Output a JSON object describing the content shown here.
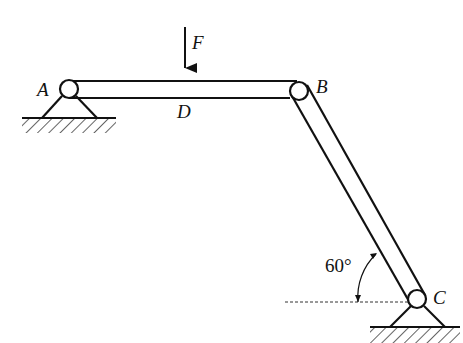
{
  "diagram": {
    "type": "frame-mechanics",
    "labels": {
      "A": "A",
      "B": "B",
      "C": "C",
      "D": "D",
      "force": "F",
      "angle": "60°"
    },
    "elements": {
      "beam_AB": "horizontal member from pin A to pin B",
      "member_BC": "inclined member from pin B to pin C",
      "support_A": "pin support",
      "support_C": "pin support",
      "load": "downward force F applied at D"
    },
    "colors": {
      "stroke": "#111111",
      "background": "#ffffff"
    }
  }
}
